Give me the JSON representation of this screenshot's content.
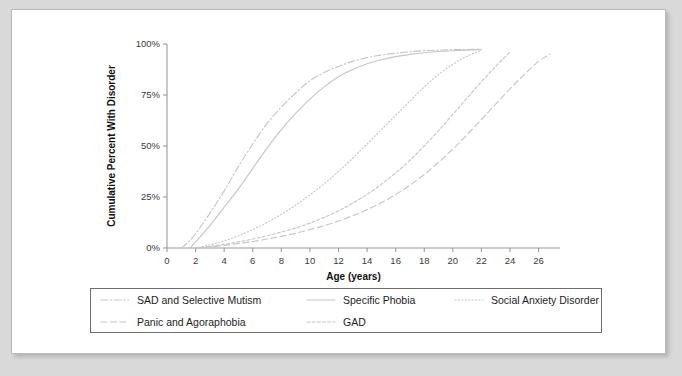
{
  "chart_data": {
    "type": "line",
    "title": "",
    "xlabel": "Age (years)",
    "ylabel": "Cumulative Percent With Disorder",
    "xlim": [
      0,
      27.5
    ],
    "ylim": [
      0,
      100
    ],
    "xticks": [
      0,
      2,
      4,
      6,
      8,
      10,
      12,
      14,
      16,
      18,
      20,
      22,
      24,
      26
    ],
    "xtick_labels": [
      "0",
      "2",
      "4",
      "6",
      "8",
      "10",
      "12",
      "14",
      "16",
      "18",
      "20",
      "22",
      "24",
      "26"
    ],
    "yticks": [
      0,
      25,
      50,
      75,
      100
    ],
    "ytick_labels": [
      "0%",
      "25%",
      "50%",
      "75%",
      "100%"
    ],
    "grid": false,
    "legend_position": "below-plot",
    "line_color": "#c6c6c6",
    "series": [
      {
        "name": "SAD and Selective Mutism",
        "dash": "dashdot",
        "x": [
          1.0,
          1.5,
          2,
          3,
          4,
          5,
          6,
          7,
          8,
          9,
          10,
          11,
          12,
          13,
          14,
          15,
          16,
          17,
          18,
          19,
          20,
          21,
          22
        ],
        "y": [
          0,
          3,
          7,
          17,
          28,
          40,
          51,
          61,
          69,
          76,
          82,
          86,
          89,
          91.5,
          93.3,
          94.6,
          95.5,
          96.2,
          96.7,
          97,
          97.2,
          97.3,
          97.4
        ]
      },
      {
        "name": "Specific Phobia",
        "dash": "solid",
        "x": [
          1.6,
          2,
          3,
          4,
          5,
          6,
          7,
          8,
          9,
          10,
          11,
          12,
          13,
          14,
          15,
          16,
          17,
          18,
          19,
          20,
          21,
          22
        ],
        "y": [
          0,
          3,
          11,
          20,
          29,
          39,
          49,
          58,
          66,
          73,
          79,
          84,
          87.5,
          90.3,
          92.3,
          93.8,
          94.9,
          95.7,
          96.3,
          96.7,
          97,
          97.2
        ]
      },
      {
        "name": "Social Anxiety Disorder",
        "dash": "dotted",
        "x": [
          2,
          3,
          4,
          5,
          6,
          7,
          8,
          9,
          10,
          11,
          12,
          13,
          14,
          15,
          16,
          17,
          18,
          19,
          20,
          21,
          22
        ],
        "y": [
          0,
          1.5,
          3.5,
          6,
          9,
          12.5,
          16.5,
          21,
          26,
          31.5,
          37.5,
          44,
          51,
          58,
          65,
          72,
          79,
          85,
          90,
          94,
          97
        ]
      },
      {
        "name": "Panic and Agoraphobia",
        "dash": "dashed",
        "x": [
          2,
          3,
          4,
          5,
          6,
          7,
          8,
          9,
          10,
          11,
          12,
          13,
          14,
          15,
          16,
          17,
          18,
          19,
          20,
          21,
          22,
          23,
          24,
          25,
          26,
          26.8
        ],
        "y": [
          0,
          0.6,
          1.3,
          2.2,
          3.2,
          4.4,
          5.7,
          7.2,
          9,
          11,
          13.2,
          15.8,
          18.8,
          22.2,
          26.2,
          30.8,
          36,
          42,
          48.5,
          55.5,
          63,
          70.5,
          78,
          85,
          91.5,
          95
        ]
      },
      {
        "name": "GAD",
        "dash": "finedash",
        "x": [
          2,
          3,
          4,
          5,
          6,
          7,
          8,
          9,
          10,
          11,
          12,
          13,
          14,
          15,
          16,
          17,
          18,
          19,
          20,
          21,
          22,
          23,
          24
        ],
        "y": [
          0,
          0.8,
          1.8,
          3,
          4.4,
          6,
          7.8,
          9.8,
          12.2,
          15,
          18.2,
          22,
          26.3,
          31.2,
          36.8,
          43,
          50,
          57.5,
          65.5,
          73.5,
          81.5,
          89,
          96
        ]
      }
    ]
  },
  "legend": {
    "entries": [
      {
        "label": "SAD and Selective Mutism",
        "dash": "dashdot"
      },
      {
        "label": "Specific Phobia",
        "dash": "solid"
      },
      {
        "label": "Social Anxiety Disorder",
        "dash": "dotted"
      },
      {
        "label": "Panic and Agoraphobia",
        "dash": "dashed"
      },
      {
        "label": "GAD",
        "dash": "finedash"
      }
    ]
  }
}
